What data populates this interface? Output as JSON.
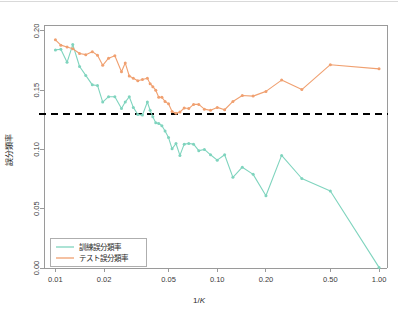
{
  "chart_data": {
    "type": "line",
    "title": "",
    "xlabel": "1/K",
    "ylabel": "誤分類率",
    "xscale": "log",
    "xlim": [
      0.0085,
      1.12
    ],
    "ylim": [
      0.0,
      0.205
    ],
    "grid": false,
    "legend_position": "bottom-left",
    "xticks": [
      0.01,
      0.02,
      0.05,
      0.1,
      0.2,
      0.5,
      1.0
    ],
    "xtick_labels": [
      "0.01",
      "0.02",
      "0.05",
      "0.10",
      "0.20",
      "0.50",
      "1.00"
    ],
    "yticks": [
      0.0,
      0.05,
      0.1,
      0.15,
      0.2
    ],
    "ytick_labels": [
      "0.00",
      "0.05",
      "0.10",
      "0.15",
      "0.20"
    ],
    "annotations": [
      {
        "name": "bayes-error-threshold",
        "type": "hline",
        "y": 0.13,
        "style": "dashed",
        "color": "#000000"
      }
    ],
    "series": [
      {
        "name": "訓練誤分類率",
        "color": "#7FD4BE",
        "marker": "dot",
        "x": [
          0.01,
          0.0108,
          0.0118,
          0.0128,
          0.0141,
          0.0154,
          0.0169,
          0.0182,
          0.0196,
          0.0213,
          0.0233,
          0.0256,
          0.027,
          0.0286,
          0.0303,
          0.0323,
          0.0345,
          0.037,
          0.0385,
          0.04,
          0.0417,
          0.0435,
          0.0455,
          0.0476,
          0.05,
          0.0526,
          0.0556,
          0.0588,
          0.0625,
          0.0667,
          0.0714,
          0.0769,
          0.0833,
          0.0909,
          0.1,
          0.1111,
          0.125,
          0.1429,
          0.1667,
          0.2,
          0.25,
          0.3333,
          0.5,
          1.0
        ],
        "y": [
          0.184,
          0.1845,
          0.1735,
          0.1885,
          0.17,
          0.1625,
          0.1545,
          0.154,
          0.14,
          0.1445,
          0.1445,
          0.1345,
          0.14,
          0.1445,
          0.1355,
          0.1295,
          0.129,
          0.14,
          0.133,
          0.1275,
          0.1225,
          0.122,
          0.12,
          0.1155,
          0.11,
          0.1005,
          0.105,
          0.095,
          0.1045,
          0.105,
          0.1045,
          0.099,
          0.1,
          0.0955,
          0.091,
          0.0955,
          0.0765,
          0.085,
          0.079,
          0.061,
          0.095,
          0.0755,
          0.065,
          0.0005
        ]
      },
      {
        "name": "テスト誤分類率",
        "color": "#F0A070",
        "marker": "dot",
        "x": [
          0.01,
          0.0108,
          0.0118,
          0.0128,
          0.0141,
          0.0154,
          0.0169,
          0.0182,
          0.0196,
          0.0213,
          0.0233,
          0.0256,
          0.027,
          0.0286,
          0.0303,
          0.0323,
          0.0345,
          0.037,
          0.0385,
          0.04,
          0.0417,
          0.0435,
          0.0455,
          0.0476,
          0.05,
          0.0526,
          0.0556,
          0.0588,
          0.0625,
          0.0667,
          0.0714,
          0.0769,
          0.0833,
          0.0909,
          0.1,
          0.1111,
          0.125,
          0.1429,
          0.1667,
          0.2,
          0.25,
          0.3333,
          0.5,
          1.0
        ],
        "y": [
          0.1925,
          0.188,
          0.1865,
          0.185,
          0.181,
          0.18,
          0.1825,
          0.1795,
          0.171,
          0.177,
          0.179,
          0.1655,
          0.173,
          0.162,
          0.16,
          0.158,
          0.159,
          0.16,
          0.1555,
          0.153,
          0.15,
          0.144,
          0.144,
          0.1405,
          0.1385,
          0.132,
          0.1305,
          0.1315,
          0.135,
          0.1345,
          0.138,
          0.138,
          0.134,
          0.133,
          0.1355,
          0.1335,
          0.1405,
          0.1455,
          0.145,
          0.149,
          0.1585,
          0.1505,
          0.1715,
          0.168
        ]
      }
    ]
  },
  "legend": {
    "entries": [
      {
        "label": "訓練誤分類率",
        "color": "#7FD4BE"
      },
      {
        "label": "テスト誤分類率",
        "color": "#F0A070"
      }
    ]
  }
}
